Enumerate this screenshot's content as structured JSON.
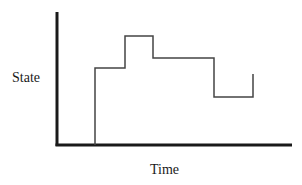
{
  "diagram": {
    "type": "step-line",
    "ylabel": "State",
    "xlabel": "Time",
    "colors": {
      "axes": "#1a1a1a",
      "line": "#444444",
      "background": "#ffffff"
    },
    "axes": {
      "origin": [
        57,
        145
      ],
      "y_top": 12,
      "x_right": 292
    },
    "step_points": [
      [
        95,
        145
      ],
      [
        95,
        68
      ],
      [
        125,
        68
      ],
      [
        125,
        36
      ],
      [
        153,
        36
      ],
      [
        153,
        58
      ],
      [
        214,
        58
      ],
      [
        214,
        97
      ],
      [
        253,
        97
      ],
      [
        253,
        74
      ]
    ]
  }
}
